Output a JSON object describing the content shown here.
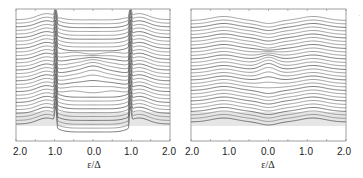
{
  "chart_data": [
    {
      "type": "line",
      "title": "",
      "xlabel": "ε/Δ",
      "ylabel": "",
      "x_ticks": [
        "2.0",
        "1.0",
        "0.0",
        "1.0",
        "2.0"
      ],
      "x_tick_values": [
        -2.0,
        -1.0,
        0.0,
        1.0,
        2.0
      ],
      "xlim": [
        -2.0,
        2.0
      ],
      "grid": false,
      "legend": null,
      "description": "Waterfall of ~30 offset density-of-states traces with coherence peaks at ε/Δ≈±1 and in-gap structure near 0",
      "n_traces": 30,
      "features": {
        "gap_edge": 1.0,
        "outer_hump": 1.2,
        "mid_gap_bump_traces": [
          10,
          20
        ]
      }
    },
    {
      "type": "line",
      "title": "",
      "xlabel": "ε/Δ",
      "ylabel": "",
      "x_ticks": [
        "2.0",
        "1.0",
        "0.0",
        "1.0",
        "2.0"
      ],
      "x_tick_values": [
        -2.0,
        -1.0,
        0.0,
        1.0,
        2.0
      ],
      "xlim": [
        -2.0,
        2.0
      ],
      "grid": false,
      "legend": null,
      "description": "Waterfall of ~30 offset smooth traces with broad humps at ε/Δ≈±1.2, a dip at 0, and a central bump for middle traces",
      "n_traces": 30,
      "features": {
        "outer_hump": 1.2,
        "central_bump_traces": [
          10,
          20
        ]
      }
    }
  ],
  "panels": [
    {
      "ticks": [
        "2.0",
        "1.0",
        "0.0",
        "1.0",
        "2.0"
      ],
      "xlabel": "ε/Δ"
    },
    {
      "ticks": [
        "2.0",
        "1.0",
        "0.0",
        "1.0",
        "2.0"
      ],
      "xlabel": "ε/Δ"
    }
  ]
}
